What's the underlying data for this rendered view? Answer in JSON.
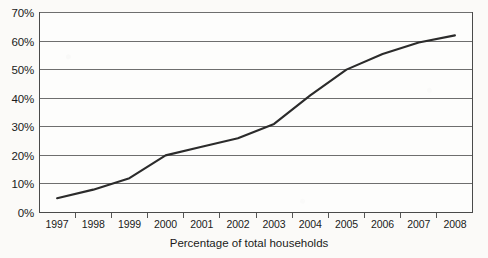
{
  "chart_data": {
    "type": "line",
    "title": "",
    "subtitle": "",
    "xlabel": "Percentage of total households",
    "ylabel": "",
    "categories": [
      "1997",
      "1998",
      "1999",
      "2000",
      "2001",
      "2002",
      "2003",
      "2004",
      "2005",
      "2006",
      "2007",
      "2008"
    ],
    "values": [
      5,
      8,
      12,
      20,
      23,
      26,
      31,
      41,
      50,
      55.5,
      59.5,
      62
    ],
    "series": [
      {
        "name": "Percentage of total households",
        "values": [
          5,
          8,
          12,
          20,
          23,
          26,
          31,
          41,
          50,
          55.5,
          59.5,
          62
        ]
      }
    ],
    "ylim": [
      0,
      70
    ],
    "ytick_labels": [
      "0%",
      "10%",
      "20%",
      "30%",
      "40%",
      "50%",
      "60%",
      "70%"
    ],
    "ytick_values": [
      0,
      10,
      20,
      30,
      40,
      50,
      60,
      70
    ],
    "xtick_labels": [
      "1997",
      "1998",
      "1999",
      "2000",
      "2001",
      "2002",
      "2003",
      "2004",
      "2005",
      "2006",
      "2007",
      "2008"
    ],
    "grid": "horizontal",
    "legend": "none",
    "line_color": "#2b2b2b",
    "grid_color": "#6e6e6e",
    "frame_color": "#4a4a4a",
    "background_color": "#fbfaf8",
    "text_color": "#1a1a1a"
  },
  "axis": {
    "x_title": "Percentage of total households"
  }
}
